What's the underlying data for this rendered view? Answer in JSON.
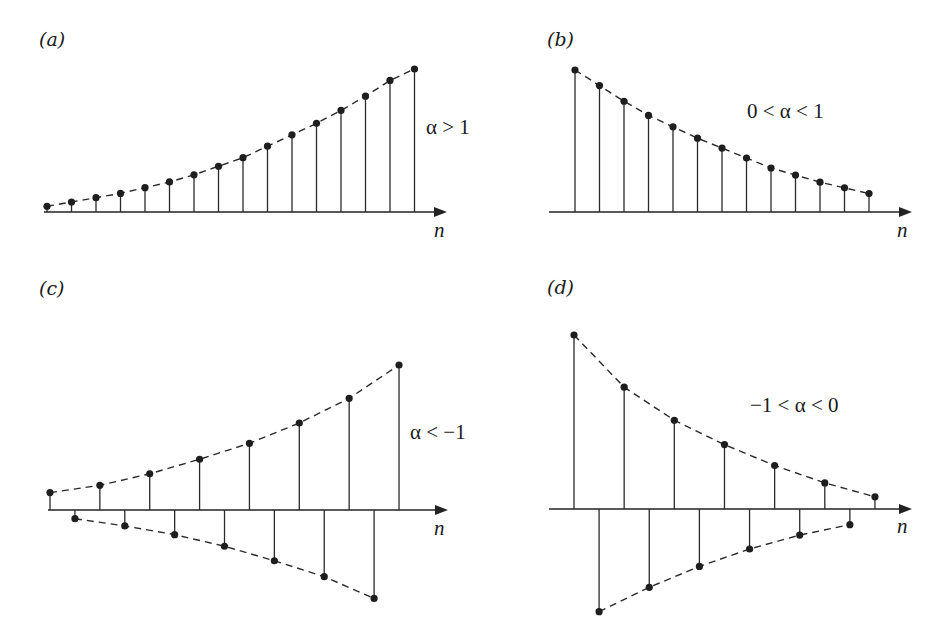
{
  "figure": {
    "panels": [
      {
        "id": "a",
        "label": "(a)",
        "condition": "α > 1",
        "axis_label": "n",
        "behavior": "growing, positive"
      },
      {
        "id": "b",
        "label": "(b)",
        "condition": "0 < α < 1",
        "axis_label": "n",
        "behavior": "decaying, positive"
      },
      {
        "id": "c",
        "label": "(c)",
        "condition": "α < −1",
        "axis_label": "n",
        "behavior": "growing, alternating sign"
      },
      {
        "id": "d",
        "label": "(d)",
        "condition": "−1 < α < 0",
        "axis_label": "n",
        "behavior": "decaying, alternating sign"
      }
    ]
  },
  "chart_data": [
    {
      "type": "stem",
      "panel": "(a)",
      "title": "α > 1",
      "xlabel": "n",
      "ylabel": "",
      "grid": false,
      "x": [
        0,
        1,
        2,
        3,
        4,
        5,
        6,
        7,
        8,
        9,
        10,
        11,
        12,
        13,
        14,
        15
      ],
      "values": [
        0.04,
        0.07,
        0.1,
        0.13,
        0.17,
        0.21,
        0.26,
        0.32,
        0.38,
        0.46,
        0.54,
        0.62,
        0.71,
        0.81,
        0.92,
        1.0
      ],
      "envelope": "dashed"
    },
    {
      "type": "stem",
      "panel": "(b)",
      "title": "0 < α < 1",
      "xlabel": "n",
      "ylabel": "",
      "grid": false,
      "x": [
        0,
        1,
        2,
        3,
        4,
        5,
        6,
        7,
        8,
        9,
        10,
        11,
        12
      ],
      "values": [
        1.0,
        0.89,
        0.78,
        0.68,
        0.6,
        0.52,
        0.45,
        0.38,
        0.31,
        0.26,
        0.21,
        0.17,
        0.13
      ],
      "envelope": "dashed"
    },
    {
      "type": "stem",
      "panel": "(c)",
      "title": "α < −1",
      "xlabel": "n",
      "ylabel": "",
      "grid": false,
      "x": [
        0,
        1,
        2,
        3,
        4,
        5,
        6,
        7,
        8,
        9,
        10,
        11,
        12,
        13,
        14
      ],
      "values": [
        0.12,
        -0.06,
        0.17,
        -0.11,
        0.25,
        -0.17,
        0.35,
        -0.25,
        0.46,
        -0.35,
        0.6,
        -0.46,
        0.77,
        -0.61,
        1.0
      ],
      "envelope": "dashed (upper and lower)"
    },
    {
      "type": "stem",
      "panel": "(d)",
      "title": "−1 < α < 0",
      "xlabel": "n",
      "ylabel": "",
      "grid": false,
      "x": [
        0,
        1,
        2,
        3,
        4,
        5,
        6,
        7,
        8,
        9,
        10,
        11,
        12
      ],
      "values": [
        1.0,
        -0.59,
        0.7,
        -0.45,
        0.51,
        -0.33,
        0.37,
        -0.23,
        0.25,
        -0.15,
        0.15,
        -0.09,
        0.07
      ],
      "envelope": "dashed (upper and lower)"
    }
  ]
}
